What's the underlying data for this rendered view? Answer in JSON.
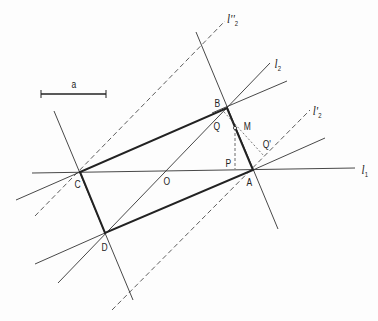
{
  "diagram": {
    "type": "geometric-construction",
    "scale_bar": {
      "label": "a"
    },
    "points": [
      {
        "id": "A",
        "label": "A",
        "x": 253,
        "y": 170
      },
      {
        "id": "B",
        "label": "B",
        "x": 227,
        "y": 108
      },
      {
        "id": "C",
        "label": "C",
        "x": 80,
        "y": 172
      },
      {
        "id": "D",
        "label": "D",
        "x": 105,
        "y": 233
      },
      {
        "id": "O",
        "label": "O",
        "x": 166,
        "y": 171
      },
      {
        "id": "M",
        "label": "M",
        "x": 235,
        "y": 128
      },
      {
        "id": "P",
        "label": "P",
        "x": 235,
        "y": 169
      },
      {
        "id": "Q",
        "label": "Q",
        "x": 221,
        "y": 118
      },
      {
        "id": "Q1",
        "label": "Q'",
        "x": 264,
        "y": 156
      }
    ],
    "lines": [
      {
        "id": "l1",
        "label": "l",
        "subscript": "1",
        "style": "solid"
      },
      {
        "id": "l2",
        "label": "l",
        "subscript": "2",
        "style": "solid"
      },
      {
        "id": "l2p",
        "label": "l'",
        "subscript": "2",
        "style": "dashed"
      },
      {
        "id": "l2pp",
        "label": "l''",
        "subscript": "2",
        "style": "dashed"
      }
    ],
    "rectangle": [
      "A",
      "B",
      "C",
      "D"
    ]
  }
}
